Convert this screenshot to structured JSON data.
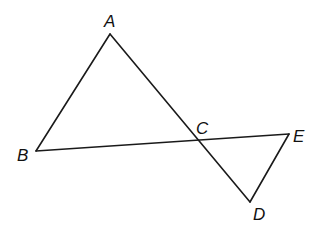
{
  "diagram": {
    "type": "geometry",
    "stroke_color": "#1a1a1a",
    "points": {
      "A": {
        "label": "A",
        "x": 110,
        "y": 34,
        "lx": 104,
        "ly": 27
      },
      "B": {
        "label": "B",
        "x": 36,
        "y": 151,
        "lx": 17,
        "ly": 161
      },
      "C": {
        "label": "C",
        "x": 198,
        "y": 140,
        "lx": 196,
        "ly": 134
      },
      "D": {
        "label": "D",
        "x": 250,
        "y": 202,
        "lx": 253,
        "ly": 220
      },
      "E": {
        "label": "E",
        "x": 289,
        "y": 134,
        "lx": 293,
        "ly": 142
      }
    },
    "segments": [
      {
        "from": "A",
        "to": "B"
      },
      {
        "from": "A",
        "to": "D"
      },
      {
        "from": "B",
        "to": "E"
      },
      {
        "from": "E",
        "to": "D"
      }
    ]
  }
}
